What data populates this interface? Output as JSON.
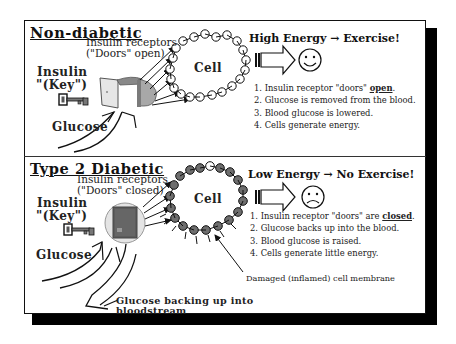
{
  "sections": {
    "non_diabetic": {
      "heading": "Non-diabetic",
      "receptor_label_line1": "Insulin receptors",
      "receptor_label_line2": "(\"Doors\" open)",
      "insulin_line1": "Insulin",
      "insulin_line2": "\"(Key\")",
      "glucose_label": "Glucose",
      "cell_label": "Cell",
      "energy_title": "High Energy → Exercise!",
      "face": "smiley",
      "steps": [
        {
          "prefix": "1. Insulin receptor \"doors\" ",
          "emph": "open",
          "suffix": "."
        },
        {
          "prefix": "2. Glucose is removed from the blood.",
          "emph": "",
          "suffix": ""
        },
        {
          "prefix": "3. Blood glucose is lowered.",
          "emph": "",
          "suffix": ""
        },
        {
          "prefix": "4. Cells generate energy.",
          "emph": "",
          "suffix": ""
        }
      ]
    },
    "type2": {
      "heading": "Type 2 Diabetic",
      "receptor_label_line1": "Insulin receptors",
      "receptor_label_line2": "(\"Doors\" closed)",
      "insulin_line1": "Insulin",
      "insulin_line2": "\"(Key\")",
      "glucose_label": "Glucose",
      "cell_label": "Cell",
      "energy_title": "Low Energy → No Exercise!",
      "face": "frowny",
      "steps": [
        {
          "prefix": "1. Insulin receptor \"doors\" are ",
          "emph": "closed",
          "suffix": "."
        },
        {
          "prefix": "2. Glucose backs up into the blood.",
          "emph": "",
          "suffix": ""
        },
        {
          "prefix": "3. Blood glucose is raised.",
          "emph": "",
          "suffix": ""
        },
        {
          "prefix": "4. Cells generate little energy.",
          "emph": "",
          "suffix": ""
        }
      ],
      "membrane_label": "Damaged (inflamed) cell membrane",
      "backup_label_line1": "Glucose backing up into",
      "backup_label_line2": "bloodstream"
    }
  },
  "colors": {
    "outline": "#111111",
    "healthy_bead": "#ffffff",
    "damaged_bead": "#6e6e6e",
    "door_open_frame": "#8a8a8a",
    "door_closed": "#5a5a5a",
    "shadow": "#000000"
  }
}
